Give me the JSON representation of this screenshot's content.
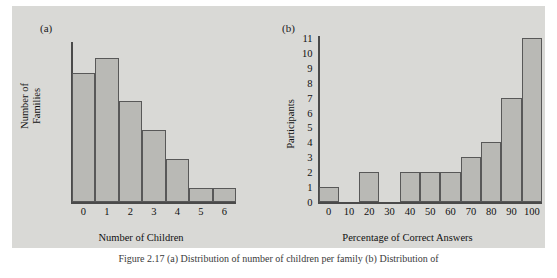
{
  "figure": {
    "background_color": "#d9d9d6",
    "bar_fill_color": "#b9b9b5",
    "bar_stroke_color": "#585858",
    "axis_color": "#4a4a4a",
    "caption": "Figure 2.17  (a) Distribution of number of children per family (b) Distribution of"
  },
  "panels": [
    {
      "letter": "(a)",
      "ylabel": "Number of\nFamilies",
      "xlabel": "Number of Children"
    },
    {
      "letter": "(b)",
      "ylabel": "Participants",
      "xlabel": "Percentage of Correct Answers"
    }
  ],
  "chart_data": [
    {
      "type": "bar",
      "title": "(a)",
      "xlabel": "Number of Children",
      "ylabel": "Number of Families",
      "xlim": [
        -0.5,
        6.5
      ],
      "ylim": [
        0,
        11
      ],
      "grid": false,
      "legend": "none",
      "xticks": [
        "0",
        "1",
        "2",
        "3",
        "4",
        "5",
        "6"
      ],
      "yticks": [],
      "categories": [
        "0",
        "1",
        "2",
        "3",
        "4",
        "5",
        "6"
      ],
      "values": [
        9,
        10,
        7,
        5,
        3,
        1,
        1
      ],
      "bin_width": 1,
      "annotations": []
    },
    {
      "type": "bar",
      "title": "(b)",
      "xlabel": "Percentage of Correct Answers",
      "ylabel": "Participants",
      "xlim": [
        -5,
        105
      ],
      "ylim": [
        0,
        11
      ],
      "grid": false,
      "legend": "none",
      "xticks": [
        "0",
        "10",
        "20",
        "30",
        "40",
        "50",
        "60",
        "70",
        "80",
        "90",
        "100"
      ],
      "yticks": [
        "0",
        "1",
        "2",
        "3",
        "4",
        "5",
        "6",
        "7",
        "8",
        "9",
        "10",
        "11"
      ],
      "categories": [
        "0-5",
        "5-15",
        "15-25",
        "25-35",
        "35-45",
        "45-55",
        "55-65",
        "65-75",
        "75-85",
        "85-95",
        "95-105"
      ],
      "bin_starts": [
        -5,
        5,
        15,
        25,
        35,
        45,
        55,
        65,
        75,
        85,
        95
      ],
      "bin_ends": [
        5,
        15,
        25,
        35,
        45,
        55,
        65,
        75,
        85,
        95,
        105
      ],
      "values": [
        1,
        0,
        2,
        0,
        2,
        2,
        2,
        3,
        4,
        7,
        11
      ],
      "bin_width": 10,
      "annotations": []
    }
  ]
}
